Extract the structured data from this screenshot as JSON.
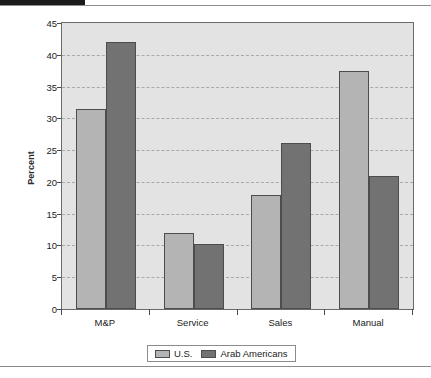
{
  "chart_data": {
    "type": "bar",
    "title": "",
    "subtitle": "",
    "xlabel": "",
    "ylabel": "Percent",
    "categories": [
      "M&P",
      "Service",
      "Sales",
      "Manual"
    ],
    "series": [
      {
        "name": "U.S.",
        "color": "#b4b4b4",
        "values": [
          31.5,
          12.0,
          17.9,
          37.4
        ]
      },
      {
        "name": "Arab Americans",
        "color": "#727272",
        "values": [
          42.0,
          10.3,
          26.2,
          21.0
        ]
      }
    ],
    "ylim": [
      0,
      45
    ],
    "ytick_labels": [
      "0",
      "5",
      "10",
      "15",
      "20",
      "25",
      "30",
      "35",
      "40",
      "45"
    ],
    "ytick_values": [
      0,
      5,
      10,
      15,
      20,
      25,
      30,
      35,
      40,
      45
    ],
    "grid": true,
    "grid_style": "dashed-horizontal",
    "legend_position": "bottom-center",
    "plot_background": "#e3e3e3",
    "axis_color": "#6a6a6a"
  },
  "figure": {
    "y_axis_title": "Percent"
  },
  "legend": {
    "entries": [
      {
        "label": "U.S."
      },
      {
        "label": "Arab Americans"
      }
    ]
  }
}
